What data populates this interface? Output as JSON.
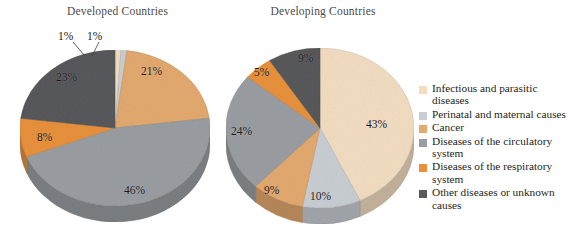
{
  "figure": {
    "background": "#ffffff"
  },
  "charts": {
    "left": {
      "title": "Developed Countries"
    },
    "right": {
      "title": "Developing Countries"
    }
  },
  "legend": {
    "items": [
      {
        "label": "Infectious and parasitic diseases",
        "color": "#f2ddc2"
      },
      {
        "label": "Perinatal and maternal causes",
        "color": "#c9ced3"
      },
      {
        "label": "Cancer",
        "color": "#e3a96f"
      },
      {
        "label": "Diseases of the circulatory system",
        "color": "#9a9ea2"
      },
      {
        "label": "Diseases of the respiratory system",
        "color": "#e8913c"
      },
      {
        "label": "Other diseases or unknown causes",
        "color": "#58595b"
      }
    ]
  },
  "chart_data": [
    {
      "type": "pie",
      "title": "Developed Countries",
      "labels": [
        "Infectious and parasitic diseases",
        "Perinatal and maternal causes",
        "Cancer",
        "Diseases of the circulatory system",
        "Diseases of the respiratory system",
        "Other diseases or unknown causes"
      ],
      "values": [
        1,
        1,
        21,
        46,
        8,
        23
      ],
      "value_labels": [
        "1%",
        "1%",
        "21%",
        "46%",
        "8%",
        "23%"
      ],
      "colors": [
        "#f2ddc2",
        "#c9ced3",
        "#e3a96f",
        "#9a9ea2",
        "#e8913c",
        "#58595b"
      ],
      "units": "percent",
      "start_angle_deg": 0,
      "direction": "clockwise",
      "legend_position": "right",
      "grid": false
    },
    {
      "type": "pie",
      "title": "Developing Countries",
      "labels": [
        "Infectious and parasitic diseases",
        "Perinatal and maternal causes",
        "Cancer",
        "Diseases of the circulatory system",
        "Diseases of the respiratory system",
        "Other diseases or unknown causes"
      ],
      "values": [
        43,
        10,
        9,
        24,
        5,
        9
      ],
      "value_labels": [
        "43%",
        "10%",
        "9%",
        "24%",
        "5%",
        "9%"
      ],
      "colors": [
        "#f2ddc2",
        "#c9ced3",
        "#e3a96f",
        "#9a9ea2",
        "#e8913c",
        "#58595b"
      ],
      "units": "percent",
      "start_angle_deg": 0,
      "direction": "clockwise",
      "legend_position": "right",
      "grid": false
    }
  ]
}
